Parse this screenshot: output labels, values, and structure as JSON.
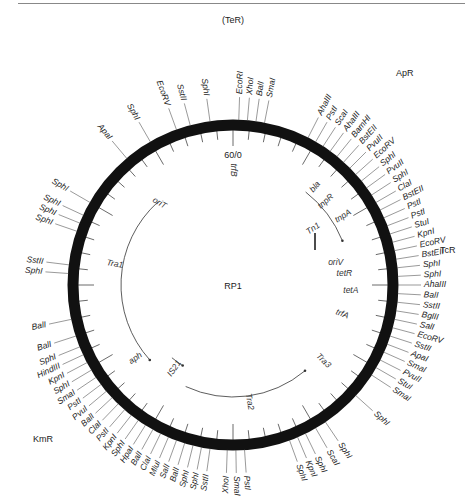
{
  "plasmid": {
    "name": "RP1",
    "origin_label": "60/0",
    "center": [
      233,
      285
    ],
    "radius": 160
  },
  "resistance_markers": [
    {
      "label": "(TeR)",
      "x": 222,
      "y": 23
    },
    {
      "label": "ApR",
      "x": 396,
      "y": 76
    },
    {
      "label": "TcR",
      "x": 440,
      "y": 253
    },
    {
      "label": "KmR",
      "x": 33,
      "y": 442
    }
  ],
  "genes": [
    {
      "label": "trfB",
      "angle": 0,
      "r": 115,
      "rot": 90
    },
    {
      "label": "bla",
      "angle": 40,
      "r": 128,
      "rot": -50
    },
    {
      "label": "tnpR",
      "angle": 48,
      "r": 125,
      "rot": -42
    },
    {
      "label": "Tn1",
      "angle": 55,
      "r": 98,
      "rot": -35
    },
    {
      "label": "tnpA",
      "angle": 58,
      "r": 130,
      "rot": -32
    },
    {
      "label": "oriV",
      "angle": 78,
      "r": 105,
      "rot": 0
    },
    {
      "label": "tetR",
      "angle": 84,
      "r": 112,
      "rot": 0
    },
    {
      "label": "tetA",
      "angle": 93,
      "r": 118,
      "rot": 0
    },
    {
      "label": "trfA",
      "angle": 105,
      "r": 113,
      "rot": 20
    },
    {
      "label": "Tra3",
      "angle": 130,
      "r": 118,
      "rot": 45
    },
    {
      "label": "Tra2",
      "angle": 172,
      "r": 118,
      "rot": 80
    },
    {
      "label": "IS21",
      "angle": 215,
      "r": 102,
      "rot": -55
    },
    {
      "label": "aph",
      "angle": 233,
      "r": 122,
      "rot": -35
    },
    {
      "label": "Tra1",
      "angle": 280,
      "r": 120,
      "rot": 10
    },
    {
      "label": "oriT",
      "angle": 318,
      "r": 110,
      "rot": 30
    }
  ],
  "sites": [
    {
      "label": "EcoRI",
      "angle": 2
    },
    {
      "label": "XhoI",
      "angle": 5
    },
    {
      "label": "BalI",
      "angle": 8
    },
    {
      "label": "SmaI",
      "angle": 11
    },
    {
      "label": "SphI",
      "angle": -8
    },
    {
      "label": "SstII",
      "angle": -15
    },
    {
      "label": "EcoRV",
      "angle": -20
    },
    {
      "label": "SphI",
      "angle": -30
    },
    {
      "label": "ApaI",
      "angle": -40
    },
    {
      "label": "AhaIII",
      "angle": 27
    },
    {
      "label": "PstI",
      "angle": 30
    },
    {
      "label": "ScaI",
      "angle": 33
    },
    {
      "label": "AhaIII",
      "angle": 36
    },
    {
      "label": "BamHI",
      "angle": 39
    },
    {
      "label": "BstEII",
      "angle": 42
    },
    {
      "label": "PvuII",
      "angle": 45
    },
    {
      "label": "EcoRV",
      "angle": 48
    },
    {
      "label": "SphI",
      "angle": 51
    },
    {
      "label": "PvuII",
      "angle": 54
    },
    {
      "label": "SphI",
      "angle": 57
    },
    {
      "label": "ClaI",
      "angle": 60
    },
    {
      "label": "BstEII",
      "angle": 63
    },
    {
      "label": "PstI",
      "angle": 66
    },
    {
      "label": "PstI",
      "angle": 69
    },
    {
      "label": "StuI",
      "angle": 72
    },
    {
      "label": "KpnI",
      "angle": 75
    },
    {
      "label": "EcoRV",
      "angle": 78
    },
    {
      "label": "BstEII",
      "angle": 81
    },
    {
      "label": "SphI",
      "angle": 84
    },
    {
      "label": "SphI",
      "angle": 87
    },
    {
      "label": "AhaIII",
      "angle": 90
    },
    {
      "label": "BalI",
      "angle": 93
    },
    {
      "label": "SstII",
      "angle": 96
    },
    {
      "label": "BglII",
      "angle": 99
    },
    {
      "label": "SalI",
      "angle": 102
    },
    {
      "label": "EcoRV",
      "angle": 105
    },
    {
      "label": "SstII",
      "angle": 108
    },
    {
      "label": "ApaI",
      "angle": 111
    },
    {
      "label": "SmaI",
      "angle": 114
    },
    {
      "label": "PvuII",
      "angle": 117
    },
    {
      "label": "StuI",
      "angle": 120
    },
    {
      "label": "SmaI",
      "angle": 123
    },
    {
      "label": "SphI",
      "angle": 132
    },
    {
      "label": "SphI",
      "angle": 146
    },
    {
      "label": "ScaI",
      "angle": 150
    },
    {
      "label": "SphI",
      "angle": 154
    },
    {
      "label": "KpnI",
      "angle": 157
    },
    {
      "label": "SphI",
      "angle": 160
    },
    {
      "label": "PstI",
      "angle": 176
    },
    {
      "label": "SmaI",
      "angle": 179
    },
    {
      "label": "XhoI",
      "angle": 182
    },
    {
      "label": "SstII",
      "angle": 188
    },
    {
      "label": "SphI",
      "angle": 191
    },
    {
      "label": "SphI",
      "angle": 194
    },
    {
      "label": "BalI",
      "angle": 197
    },
    {
      "label": "SalI",
      "angle": 200
    },
    {
      "label": "MluI",
      "angle": 203
    },
    {
      "label": "ClaI",
      "angle": 206
    },
    {
      "label": "BalI",
      "angle": 209
    },
    {
      "label": "HpaI",
      "angle": 212
    },
    {
      "label": "SphI",
      "angle": 215
    },
    {
      "label": "KpnI",
      "angle": 218
    },
    {
      "label": "PstI",
      "angle": 221
    },
    {
      "label": "ClaI",
      "angle": 224
    },
    {
      "label": "BalI",
      "angle": 227
    },
    {
      "label": "PvuI",
      "angle": 230
    },
    {
      "label": "PstI",
      "angle": 233
    },
    {
      "label": "SmaI",
      "angle": 236
    },
    {
      "label": "SphI",
      "angle": 239
    },
    {
      "label": "KpnI",
      "angle": 242
    },
    {
      "label": "HindIII",
      "angle": 245
    },
    {
      "label": "SphI",
      "angle": 248
    },
    {
      "label": "BalI",
      "angle": 252
    },
    {
      "label": "BalI",
      "angle": 258
    },
    {
      "label": "SphI",
      "angle": 274
    },
    {
      "label": "SstII",
      "angle": 277
    },
    {
      "label": "SphI",
      "angle": 289
    },
    {
      "label": "SphI",
      "angle": 292
    },
    {
      "label": "SphI",
      "angle": 295
    },
    {
      "label": "SphI",
      "angle": 300
    }
  ]
}
